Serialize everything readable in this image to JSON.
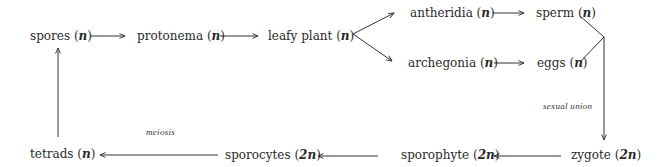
{
  "diagram": {
    "type": "life-cycle-flow",
    "colors": {
      "text": "#2a2a2a",
      "line": "#333333",
      "background": "#ffffff"
    },
    "nodes": [
      {
        "id": "spores",
        "name": "spores",
        "ploidy": "n"
      },
      {
        "id": "protonema",
        "name": "protonema",
        "ploidy": "n"
      },
      {
        "id": "leafy_plant",
        "name": "leafy plant",
        "ploidy": "n"
      },
      {
        "id": "antheridia",
        "name": "antheridia",
        "ploidy": "n"
      },
      {
        "id": "sperm",
        "name": "sperm",
        "ploidy": "n"
      },
      {
        "id": "archegonia",
        "name": "archegonia",
        "ploidy": "n"
      },
      {
        "id": "eggs",
        "name": "eggs",
        "ploidy": "n"
      },
      {
        "id": "zygote",
        "name": "zygote",
        "ploidy": "2n"
      },
      {
        "id": "sporophyte",
        "name": "sporophyte",
        "ploidy": "2n"
      },
      {
        "id": "sporocytes",
        "name": "sporocytes",
        "ploidy": "2n"
      },
      {
        "id": "tetrads",
        "name": "tetrads",
        "ploidy": "n"
      }
    ],
    "edges": [
      {
        "from": "spores",
        "to": "protonema",
        "label": ""
      },
      {
        "from": "protonema",
        "to": "leafy_plant",
        "label": ""
      },
      {
        "from": "leafy_plant",
        "to": "antheridia",
        "label": ""
      },
      {
        "from": "leafy_plant",
        "to": "archegonia",
        "label": ""
      },
      {
        "from": "antheridia",
        "to": "sperm",
        "label": ""
      },
      {
        "from": "archegonia",
        "to": "eggs",
        "label": ""
      },
      {
        "from": "sperm",
        "to": "zygote",
        "label": "sexual union"
      },
      {
        "from": "eggs",
        "to": "zygote",
        "label": "sexual union"
      },
      {
        "from": "zygote",
        "to": "sporophyte",
        "label": ""
      },
      {
        "from": "sporophyte",
        "to": "sporocytes",
        "label": ""
      },
      {
        "from": "sporocytes",
        "to": "tetrads",
        "label": "meiosis"
      },
      {
        "from": "tetrads",
        "to": "spores",
        "label": ""
      }
    ],
    "edge_labels": {
      "sexual_union": "sexual union",
      "meiosis": "meiosis"
    }
  }
}
